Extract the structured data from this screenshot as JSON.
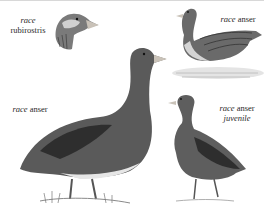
{
  "figure": {
    "type": "illustration-plate",
    "palette": {
      "background": "#ffffff",
      "ink_dark": "#2e2e2e",
      "ink_mid": "#6a6a6a",
      "ink_light": "#b8b8b8",
      "bill": "#c9c2b8"
    },
    "labels": [
      {
        "race_word": "race",
        "name": "rubirostris",
        "sub": ""
      },
      {
        "race_word": "race",
        "name": "anser",
        "sub": ""
      },
      {
        "race_word": "race",
        "name": "anser",
        "sub": ""
      },
      {
        "race_word": "race",
        "name": "anser",
        "sub": "juvenile"
      }
    ],
    "illustrations": [
      {
        "id": "head-rubirostris",
        "desc": "head of goose, race rubirostris"
      },
      {
        "id": "swimming-anser",
        "desc": "goose swimming on water, race anser"
      },
      {
        "id": "standing-adult-anser",
        "desc": "large standing adult goose, race anser"
      },
      {
        "id": "standing-juvenile-anser",
        "desc": "standing juvenile goose, race anser"
      }
    ]
  }
}
